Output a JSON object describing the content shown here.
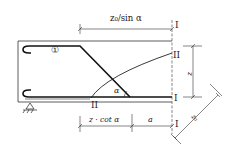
{
  "diagram": {
    "type": "reinforced-concrete-beam-bent-bar-detail",
    "labels": {
      "top_dimension": "z₀/sin α",
      "bottom_dimension_left": "z · cot  α",
      "bottom_dimension_right": "a",
      "right_dimension": "z",
      "diagonal_dimension": "z₀",
      "angle": "α",
      "bar_marker": "①",
      "section_I_top": "I",
      "section_I_mid": "I",
      "section_I_bottom": "I",
      "section_II_right": "II",
      "section_II_bottom": "II"
    },
    "colors": {
      "line": "#222222",
      "background": "#ffffff"
    }
  }
}
